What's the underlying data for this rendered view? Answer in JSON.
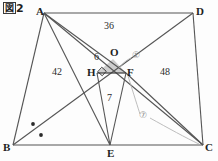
{
  "figure": {
    "caption_box": "図",
    "caption_number": "2",
    "caption_full": "図2"
  },
  "vertices": [
    {
      "name": "A",
      "label": "A",
      "x": 44,
      "y": 13
    },
    {
      "name": "D",
      "label": "D",
      "x": 193,
      "y": 13
    },
    {
      "name": "B",
      "label": "B",
      "x": 13,
      "y": 145
    },
    {
      "name": "C",
      "label": "C",
      "x": 203,
      "y": 145
    },
    {
      "name": "E",
      "label": "E",
      "x": 110,
      "y": 145
    },
    {
      "name": "O",
      "label": "O",
      "x": 113,
      "y": 58
    },
    {
      "name": "H",
      "label": "H",
      "x": 97,
      "y": 73
    },
    {
      "name": "F",
      "label": "F",
      "x": 126,
      "y": 73
    }
  ],
  "area_labels": [
    {
      "name": "area-top",
      "text": "36",
      "x": 110,
      "y": 26
    },
    {
      "name": "area-left",
      "text": "42",
      "x": 58,
      "y": 72
    },
    {
      "name": "area-right",
      "text": "48",
      "x": 166,
      "y": 72
    },
    {
      "name": "area-small-upper",
      "text": "6",
      "x": 98,
      "y": 58
    },
    {
      "name": "area-lower",
      "text": "7",
      "x": 110,
      "y": 98
    }
  ],
  "callouts": [
    {
      "name": "callout-circled-one",
      "text": "①",
      "x": 136,
      "y": 57
    },
    {
      "name": "callout-circled-seven",
      "text": "⑦",
      "x": 143,
      "y": 117
    }
  ],
  "markers": {
    "angle_dots": [
      {
        "name": "angle-dot-upper",
        "x": 33,
        "y": 124
      },
      {
        "name": "angle-dot-lower",
        "x": 41,
        "y": 135
      }
    ],
    "right_angle_square": {
      "name": "right-angle-mark-h",
      "x": 102,
      "y": 73
    },
    "shaded_triangle": {
      "name": "shaded-triangle-hof",
      "fill": "#cfcfcf"
    }
  },
  "colors": {
    "stroke": "#555555",
    "stroke_dark": "#3a3a3a",
    "leader": "#b6b6b6",
    "shade": "#cdcdcd",
    "text": "#2b2b2b",
    "background": "#fdfdfd"
  }
}
